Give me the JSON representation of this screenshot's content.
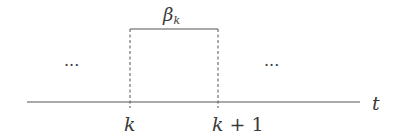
{
  "diagram": {
    "type": "timeline-pulse",
    "axis": {
      "label": "t"
    },
    "pulse": {
      "label_main": "β",
      "label_sub": "k",
      "start_label": "k",
      "end_label_var": "k",
      "end_label_rest": "+ 1"
    },
    "ellipsis_left": "···",
    "ellipsis_right": "···",
    "colors": {
      "line": "#555555",
      "text": "#3a3a3a",
      "background": "#ffffff"
    }
  }
}
